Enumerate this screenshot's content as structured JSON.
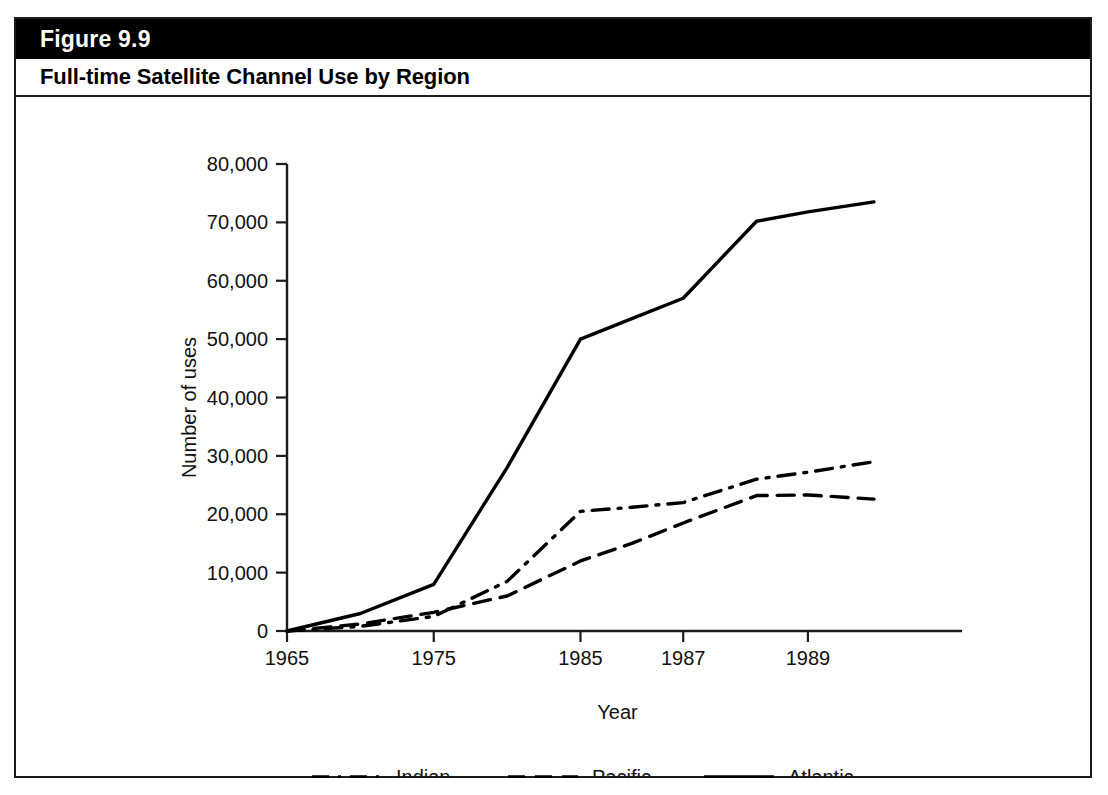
{
  "figure": {
    "number_label": "Figure 9.9",
    "title": "Full-time Satellite Channel Use by Region"
  },
  "chart_data": {
    "type": "line",
    "title": "Full-time Satellite Channel Use by Region",
    "xlabel": "Year",
    "ylabel": "Number of uses",
    "grid": false,
    "legend_position": "bottom",
    "xlim": [
      1965,
      1990
    ],
    "ylim": [
      0,
      80000
    ],
    "ytick_labels": [
      "0",
      "10,000",
      "20,000",
      "30,000",
      "40,000",
      "50,000",
      "60,000",
      "70,000",
      "80,000"
    ],
    "ytick_values": [
      0,
      10000,
      20000,
      30000,
      40000,
      50000,
      60000,
      70000,
      80000
    ],
    "xtick_labels": [
      "1965",
      "1975",
      "1985",
      "1987",
      "1989"
    ],
    "xtick_values": [
      1965,
      1975,
      1985,
      1987,
      1989
    ],
    "x": [
      1965,
      1970,
      1975,
      1980,
      1985,
      1986,
      1987,
      1988,
      1989,
      1990
    ],
    "series": [
      {
        "name": "Indian",
        "style": "dash-dot",
        "values": [
          0,
          800,
          2500,
          8500,
          20500,
          21200,
          22000,
          26000,
          27200,
          29000
        ]
      },
      {
        "name": "Pacific",
        "style": "dashed",
        "values": [
          0,
          1200,
          3200,
          6000,
          12000,
          15000,
          18500,
          23200,
          23300,
          22600
        ]
      },
      {
        "name": "Atlantic",
        "style": "solid",
        "values": [
          0,
          3000,
          8000,
          28000,
          50000,
          53500,
          57000,
          70200,
          71800,
          73500
        ]
      }
    ]
  },
  "legend": {
    "items": [
      {
        "label": "Indian",
        "style": "dash-dot"
      },
      {
        "label": "Pacific",
        "style": "dashed"
      },
      {
        "label": "Atlantic",
        "style": "solid"
      }
    ]
  },
  "source_note": ""
}
